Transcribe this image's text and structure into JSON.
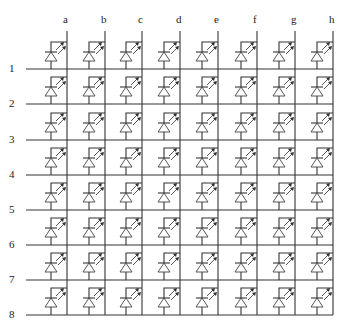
{
  "diagram": {
    "type": "led-matrix",
    "columns": [
      "a",
      "b",
      "c",
      "d",
      "e",
      "f",
      "g",
      "h"
    ],
    "rows": [
      "1",
      "2",
      "3",
      "4",
      "5",
      "6",
      "7",
      "8"
    ],
    "column_x": [
      67,
      105,
      142,
      180,
      218,
      257,
      295,
      333
    ],
    "row_y": [
      69,
      104,
      140,
      175,
      210,
      245,
      280,
      315
    ],
    "row_line_start_x": 26,
    "column_line_top_y": 31,
    "element": "light-emitting-diode",
    "colors": {
      "line": "#333333",
      "background": "#ffffff"
    }
  }
}
